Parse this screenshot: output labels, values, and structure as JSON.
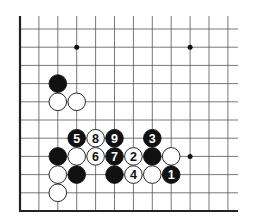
{
  "diagram": {
    "type": "go-board-fragment",
    "colors": {
      "line": "#555555",
      "border": "#222222",
      "black": "#111111",
      "white": "#ffffff",
      "background": "#ffffff"
    },
    "grid": {
      "x0": 20,
      "dx": 18.9,
      "cols": 12,
      "y_bottom": 211,
      "dy": 18.2,
      "rows": 11,
      "top_y": 16,
      "right_x": 238
    },
    "star_points": [
      {
        "col": 3,
        "row": 9
      },
      {
        "col": 9,
        "row": 9
      },
      {
        "col": 9,
        "row": 3
      }
    ],
    "stones": [
      {
        "col": 2,
        "row": 7,
        "color": "black",
        "label": ""
      },
      {
        "col": 2,
        "row": 6,
        "color": "white",
        "label": ""
      },
      {
        "col": 3,
        "row": 6,
        "color": "white",
        "label": ""
      },
      {
        "col": 3,
        "row": 4,
        "color": "black",
        "label": "5"
      },
      {
        "col": 4,
        "row": 4,
        "color": "white",
        "label": "8"
      },
      {
        "col": 5,
        "row": 4,
        "color": "black",
        "label": "9"
      },
      {
        "col": 7,
        "row": 4,
        "color": "black",
        "label": "3"
      },
      {
        "col": 2,
        "row": 3,
        "color": "black",
        "label": ""
      },
      {
        "col": 3,
        "row": 3,
        "color": "white",
        "label": ""
      },
      {
        "col": 4,
        "row": 3,
        "color": "white",
        "label": "6"
      },
      {
        "col": 5,
        "row": 3,
        "color": "black",
        "label": "7"
      },
      {
        "col": 6,
        "row": 3,
        "color": "white",
        "label": "2"
      },
      {
        "col": 7,
        "row": 3,
        "color": "black",
        "label": ""
      },
      {
        "col": 8,
        "row": 3,
        "color": "white",
        "label": ""
      },
      {
        "col": 2,
        "row": 2,
        "color": "white",
        "label": ""
      },
      {
        "col": 3,
        "row": 2,
        "color": "black",
        "label": ""
      },
      {
        "col": 5,
        "row": 2,
        "color": "black",
        "label": ""
      },
      {
        "col": 6,
        "row": 2,
        "color": "white",
        "label": "4"
      },
      {
        "col": 7,
        "row": 2,
        "color": "white",
        "label": ""
      },
      {
        "col": 8,
        "row": 2,
        "color": "black",
        "label": "1"
      },
      {
        "col": 2,
        "row": 1,
        "color": "white",
        "label": ""
      }
    ]
  }
}
